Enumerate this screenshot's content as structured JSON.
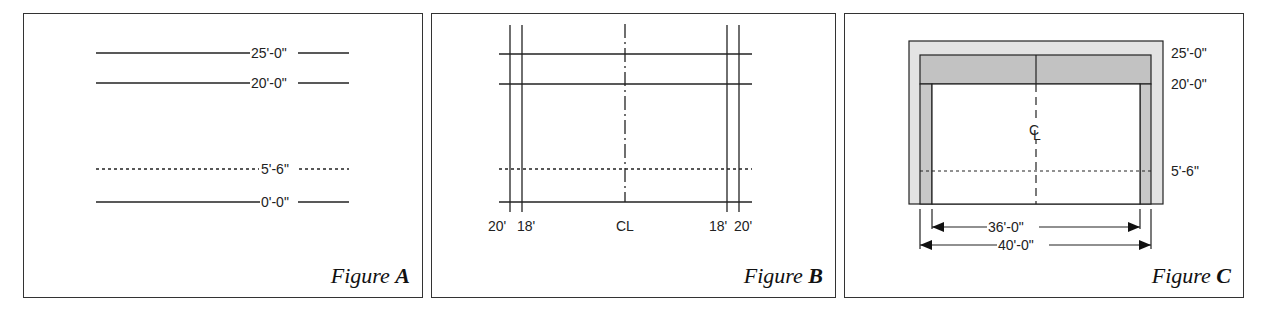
{
  "figures": [
    {
      "id": "A",
      "caption_prefix": "Figure",
      "caption_letter": "A",
      "elevation_lines": [
        {
          "label": "25'-0\"",
          "style": "solid"
        },
        {
          "label": "20'-0\"",
          "style": "solid"
        },
        {
          "label": "5'-6\"",
          "style": "dashed"
        },
        {
          "label": "0'-0\"",
          "style": "solid"
        }
      ]
    },
    {
      "id": "B",
      "caption_prefix": "Figure",
      "caption_letter": "B",
      "grid_labels": [
        "20'",
        "18'",
        "CL",
        "18'",
        "20'"
      ]
    },
    {
      "id": "C",
      "caption_prefix": "Figure",
      "caption_letter": "C",
      "elevation_labels": [
        "25'-0\"",
        "20'-0\"",
        "5'-6\""
      ],
      "centerline_symbol": "CL",
      "dimensions": [
        {
          "label": "36'-0\""
        },
        {
          "label": "40'-0\""
        }
      ]
    }
  ],
  "colors": {
    "line": "#222222",
    "outer_fill": "#e3e3e3",
    "band_fill": "#c2c2c2",
    "side_fill": "#c8c8c8"
  }
}
